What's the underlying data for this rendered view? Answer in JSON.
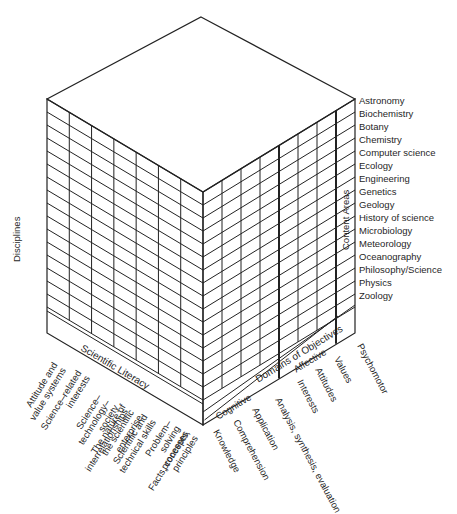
{
  "diagram": {
    "type": "three-dimensional cube matrix",
    "axes": {
      "vertical_label": "Disciplines",
      "right_label": "Content Areas",
      "left_bottom_label": "Scientific Literacy",
      "right_bottom_label": "Domains of Objectives"
    },
    "content_areas": [
      "Astronomy",
      "Biochemistry",
      "Botany",
      "Chemistry",
      "Computer science",
      "Ecology",
      "Engineering",
      "Genetics",
      "Geology",
      "History of science",
      "Microbiology",
      "Meteorology",
      "Oceanography",
      "Philosophy/Science",
      "Physics",
      "Zoology"
    ],
    "scientific_literacy": [
      "Attitude and value systems",
      "Science–related interests",
      "Science–technology–society interrelationships",
      "The nature of the scientific enterprise",
      "Scientific and technical skills",
      "Problem–solving processes",
      "Facts, concepts, principles"
    ],
    "domains": {
      "cognitive_label": "Cognitive",
      "affective_label": "Affective",
      "cognitive": [
        "Knowledge",
        "Comprehension",
        "Application",
        "Analysis, synthesis, evaluation"
      ],
      "affective": [
        "Interests",
        "Attitudes",
        "Values"
      ],
      "psychomotor": [
        "Psychomotor"
      ]
    }
  }
}
